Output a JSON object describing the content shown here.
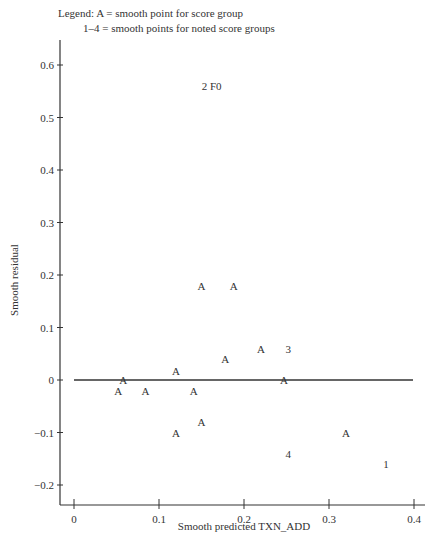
{
  "legend": {
    "line1": "Legend: A = smooth point for score group",
    "line2": "1–4 = smooth points for noted score groups"
  },
  "chart_data": {
    "type": "scatter",
    "title": "",
    "xlabel": "Smooth predicted TXN_ADD",
    "ylabel": "Smooth residual",
    "xlim": [
      -0.016,
      0.413
    ],
    "ylim": [
      -0.24,
      0.66
    ],
    "x_ticks": [
      0,
      0.1,
      0.2,
      0.3,
      0.4
    ],
    "x_tick_labels": [
      "0",
      "0.1",
      "0.2",
      "0.3",
      "0.4"
    ],
    "y_ticks": [
      0.6,
      0.5,
      0.4,
      0.3,
      0.2,
      0.1,
      0,
      -0.1,
      -0.2
    ],
    "y_tick_labels": [
      "0.6",
      "0.5",
      "0.4",
      "0.3",
      "0.2",
      "0.1",
      "0",
      "−0.1",
      "−0.2"
    ],
    "reference_line": {
      "y": 0,
      "x_from": 0,
      "x_to": 0.4
    },
    "grid": false,
    "points": [
      {
        "label": "A",
        "x": 0.058,
        "y": 0.0
      },
      {
        "label": "A",
        "x": 0.052,
        "y": -0.02
      },
      {
        "label": "A",
        "x": 0.084,
        "y": -0.02
      },
      {
        "label": "A",
        "x": 0.12,
        "y": 0.018
      },
      {
        "label": "A",
        "x": 0.141,
        "y": -0.02
      },
      {
        "label": "A",
        "x": 0.178,
        "y": 0.04
      },
      {
        "label": "A",
        "x": 0.15,
        "y": -0.08
      },
      {
        "label": "A",
        "x": 0.12,
        "y": -0.1
      },
      {
        "label": "A",
        "x": 0.15,
        "y": 0.18
      },
      {
        "label": "A",
        "x": 0.188,
        "y": 0.18
      },
      {
        "label": "A",
        "x": 0.22,
        "y": 0.06
      },
      {
        "label": "3",
        "x": 0.252,
        "y": 0.06
      },
      {
        "label": "A",
        "x": 0.247,
        "y": 0.0
      },
      {
        "label": "A",
        "x": 0.32,
        "y": -0.1
      },
      {
        "label": "4",
        "x": 0.252,
        "y": -0.14
      },
      {
        "label": "1",
        "x": 0.367,
        "y": -0.16
      },
      {
        "label": "2 F0",
        "x": 0.162,
        "y": 0.56
      }
    ]
  }
}
